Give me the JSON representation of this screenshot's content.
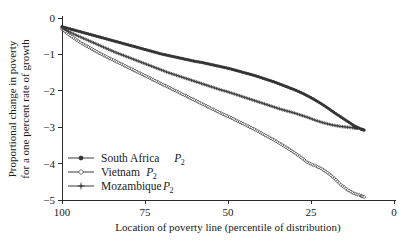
{
  "chart_data": {
    "type": "line",
    "title": "",
    "xlabel": "Location of poverty line (percentile of distribution)",
    "ylabel_line1": "Proportional change in poverty",
    "ylabel_line2": "for a one percent rate of growth",
    "xlim": [
      100,
      0
    ],
    "ylim": [
      -5,
      0
    ],
    "x_ticks": [
      100,
      75,
      50,
      25,
      0
    ],
    "x_tick_labels": [
      "100",
      "75",
      "50",
      "25",
      "0"
    ],
    "y_ticks": [
      0,
      -1,
      -2,
      -3,
      -4,
      -5
    ],
    "y_tick_labels": [
      "0",
      "−1",
      "−2",
      "−3",
      "−4",
      "−5"
    ],
    "grid": false,
    "x_axis_reversed": true,
    "legend_position": "lower-left-inside",
    "series": [
      {
        "name": "South Africa P2",
        "label_main": "South Africa",
        "label_symbol": "P",
        "label_sub": "2",
        "marker": "dot",
        "color": "#333333",
        "x": [
          100,
          98,
          96,
          94,
          92,
          90,
          88,
          86,
          84,
          82,
          80,
          78,
          76,
          74,
          72,
          70,
          68,
          66,
          64,
          62,
          60,
          58,
          56,
          54,
          52,
          50,
          48,
          46,
          44,
          42,
          40,
          38,
          36,
          34,
          32,
          30,
          28,
          26,
          24,
          22,
          20,
          18,
          16,
          14,
          12,
          10,
          9
        ],
        "y": [
          -0.24,
          -0.29,
          -0.34,
          -0.39,
          -0.44,
          -0.49,
          -0.54,
          -0.59,
          -0.64,
          -0.69,
          -0.74,
          -0.79,
          -0.84,
          -0.89,
          -0.94,
          -0.99,
          -1.03,
          -1.07,
          -1.11,
          -1.15,
          -1.19,
          -1.22,
          -1.26,
          -1.3,
          -1.34,
          -1.38,
          -1.43,
          -1.48,
          -1.53,
          -1.58,
          -1.64,
          -1.7,
          -1.76,
          -1.83,
          -1.9,
          -1.97,
          -2.05,
          -2.14,
          -2.24,
          -2.35,
          -2.47,
          -2.6,
          -2.72,
          -2.84,
          -2.96,
          -3.05,
          -3.08
        ]
      },
      {
        "name": "Vietnam P2",
        "label_main": "Vietnam",
        "label_symbol": "P",
        "label_sub": "2",
        "marker": "open-diamond",
        "color": "#333333",
        "x": [
          100,
          98,
          96,
          94,
          92,
          90,
          88,
          86,
          84,
          82,
          80,
          78,
          76,
          74,
          72,
          70,
          68,
          66,
          64,
          62,
          60,
          58,
          56,
          54,
          52,
          50,
          48,
          46,
          44,
          42,
          40,
          38,
          36,
          34,
          32,
          30,
          28,
          26,
          24,
          22,
          20,
          18,
          16,
          14,
          12,
          10,
          9
        ],
        "y": [
          -0.3,
          -0.45,
          -0.58,
          -0.7,
          -0.8,
          -0.9,
          -1.0,
          -1.09,
          -1.18,
          -1.27,
          -1.36,
          -1.45,
          -1.54,
          -1.63,
          -1.72,
          -1.81,
          -1.9,
          -1.99,
          -2.08,
          -2.17,
          -2.26,
          -2.35,
          -2.44,
          -2.53,
          -2.62,
          -2.7,
          -2.79,
          -2.88,
          -2.97,
          -3.06,
          -3.16,
          -3.26,
          -3.36,
          -3.47,
          -3.58,
          -3.7,
          -3.83,
          -3.97,
          -4.05,
          -4.13,
          -4.25,
          -4.4,
          -4.58,
          -4.72,
          -4.82,
          -4.88,
          -4.92
        ]
      },
      {
        "name": "Mozambique P2",
        "label_main": "Mozambique",
        "label_symbol": "P",
        "label_sub": "2",
        "marker": "plus",
        "color": "#333333",
        "x": [
          100,
          98,
          96,
          94,
          92,
          90,
          88,
          86,
          84,
          82,
          80,
          78,
          76,
          74,
          72,
          70,
          68,
          66,
          64,
          62,
          60,
          58,
          56,
          54,
          52,
          50,
          48,
          46,
          44,
          42,
          40,
          38,
          36,
          34,
          32,
          30,
          28,
          26,
          24,
          22,
          20,
          18,
          16,
          14,
          12,
          11
        ],
        "y": [
          -0.27,
          -0.37,
          -0.46,
          -0.54,
          -0.62,
          -0.7,
          -0.78,
          -0.86,
          -0.94,
          -1.01,
          -1.08,
          -1.15,
          -1.22,
          -1.29,
          -1.36,
          -1.43,
          -1.5,
          -1.56,
          -1.62,
          -1.68,
          -1.74,
          -1.8,
          -1.86,
          -1.92,
          -1.98,
          -2.03,
          -2.09,
          -2.15,
          -2.21,
          -2.27,
          -2.33,
          -2.39,
          -2.45,
          -2.51,
          -2.56,
          -2.61,
          -2.67,
          -2.73,
          -2.8,
          -2.86,
          -2.91,
          -2.95,
          -2.98,
          -3.0,
          -3.02,
          -3.03
        ]
      }
    ]
  }
}
